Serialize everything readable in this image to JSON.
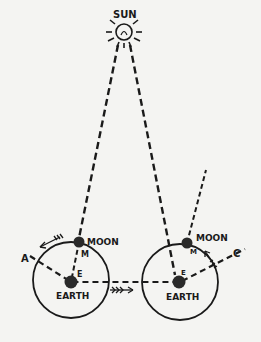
{
  "diagram": {
    "sun_label": "SUN",
    "left": {
      "moon_label": "MOON",
      "earth_label": "EARTH",
      "moon_marker": "M",
      "earth_marker": "E",
      "orbit_point_label": "A"
    },
    "right": {
      "moon_label": "MOON",
      "earth_label": "EARTH",
      "moon_marker": "M",
      "earth_marker": "E",
      "orbit_point_label": "C"
    },
    "colors": {
      "ink": "#1a1a1a",
      "paper": "#f4f4f2",
      "body_fill": "#2a2a2a"
    }
  }
}
